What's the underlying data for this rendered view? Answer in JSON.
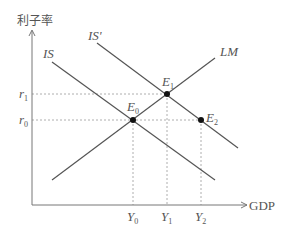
{
  "diagram": {
    "type": "IS-LM model",
    "y_axis_label": "利子率",
    "x_axis_label": "GDP",
    "curves": [
      {
        "id": "IS",
        "label": "IS"
      },
      {
        "id": "IS_prime",
        "label": "IS'"
      },
      {
        "id": "LM",
        "label": "LM"
      }
    ],
    "points": [
      {
        "id": "E0",
        "main": "E",
        "sub": "0"
      },
      {
        "id": "E1",
        "main": "E",
        "sub": "1"
      },
      {
        "id": "E2",
        "main": "E",
        "sub": "2"
      }
    ],
    "y_ticks": [
      {
        "id": "r1",
        "main": "r",
        "sub": "1"
      },
      {
        "id": "r0",
        "main": "r",
        "sub": "0"
      }
    ],
    "x_ticks": [
      {
        "id": "Y0",
        "main": "Y",
        "sub": "0"
      },
      {
        "id": "Y1",
        "main": "Y",
        "sub": "1"
      },
      {
        "id": "Y2",
        "main": "Y",
        "sub": "2"
      }
    ],
    "colors": {
      "line": "#555555",
      "guide": "#9a9a9a",
      "point": "#111111",
      "text": "#555555"
    }
  }
}
